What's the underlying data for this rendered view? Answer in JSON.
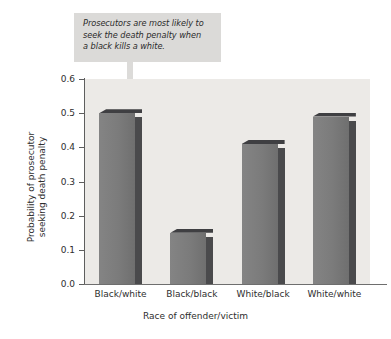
{
  "annotation": {
    "text": "Prosecutors are most likely to\nseek the death penalty when\na black kills a white.",
    "box_color": "#dbdad8",
    "text_color": "#2b2b2b"
  },
  "chart_data": {
    "type": "bar",
    "title": "",
    "xlabel": "Race of offender/victim",
    "ylabel": "Probability of prosecutor\nseeking death penalty",
    "categories": [
      "Black/white",
      "Black/black",
      "White/black",
      "White/white"
    ],
    "values": [
      0.5,
      0.15,
      0.41,
      0.49
    ],
    "ylim": [
      0.0,
      0.6
    ],
    "ytick_labels": [
      "0.6",
      "0.5",
      "0.4",
      "0.3",
      "0.2",
      "0.1",
      "0.0"
    ],
    "ytick_values": [
      0.6,
      0.5,
      0.4,
      0.3,
      0.2,
      0.1,
      0.0
    ],
    "grid": false,
    "legend": null,
    "bar_color": "#7b7b7b",
    "bar_shade_color": "#4a4a4c",
    "plot_background": "#eceae7",
    "annotations": [
      {
        "text": "Prosecutors are most likely to seek the death penalty when a black kills a white.",
        "points_to": "Black/white"
      }
    ]
  }
}
